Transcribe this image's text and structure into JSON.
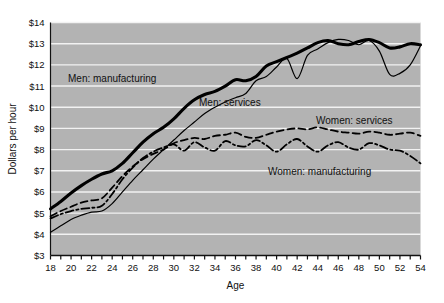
{
  "chart_data": {
    "type": "line",
    "title": "",
    "xlabel": "Age",
    "ylabel": "Dollars per hour",
    "xlim": [
      18,
      54
    ],
    "ylim": [
      3,
      14
    ],
    "grid": "horizontal",
    "legend_position": "inline-annotations",
    "plot_background": "#b3b3b3",
    "gridline_color": "#f2f2f2",
    "x_tick_labels": [
      "18",
      "20",
      "22",
      "24",
      "26",
      "28",
      "30",
      "32",
      "34",
      "36",
      "38",
      "40",
      "42",
      "44",
      "46",
      "48",
      "50",
      "52",
      "54"
    ],
    "x_tick_step": 2,
    "x_minor_tick_step": 1,
    "y_tick_labels": [
      "$3",
      "$4",
      "$5",
      "$6",
      "$7",
      "$8",
      "$9",
      "$10",
      "$11",
      "$12",
      "$13",
      "$14"
    ],
    "x": [
      18,
      19,
      20,
      21,
      22,
      23,
      24,
      25,
      26,
      27,
      28,
      29,
      30,
      31,
      32,
      33,
      34,
      35,
      36,
      37,
      38,
      39,
      40,
      41,
      42,
      43,
      44,
      45,
      46,
      47,
      48,
      49,
      50,
      51,
      52,
      53,
      54
    ],
    "series": [
      {
        "name": "Men: manufacturing",
        "label": "Men: manufacturing",
        "style": "solid-thick",
        "color": "#000000",
        "width": 3.1,
        "values": [
          5.2,
          5.55,
          5.95,
          6.3,
          6.6,
          6.85,
          7.0,
          7.35,
          7.85,
          8.35,
          8.75,
          9.05,
          9.45,
          9.95,
          10.35,
          10.6,
          10.75,
          11.0,
          11.3,
          11.25,
          11.45,
          11.95,
          12.15,
          12.35,
          12.55,
          12.8,
          13.05,
          13.15,
          13.0,
          12.95,
          13.1,
          13.2,
          13.05,
          12.8,
          12.85,
          13.0,
          12.95
        ]
      },
      {
        "name": "Men: services",
        "label": "Men: services",
        "style": "solid-thin",
        "color": "#000000",
        "width": 1.2,
        "values": [
          4.1,
          4.4,
          4.7,
          4.9,
          5.05,
          5.1,
          5.45,
          6.0,
          6.55,
          7.05,
          7.55,
          8.0,
          8.45,
          8.9,
          9.3,
          9.7,
          10.0,
          10.25,
          10.45,
          10.65,
          11.25,
          11.45,
          11.9,
          12.3,
          11.35,
          12.45,
          12.75,
          13.05,
          13.2,
          13.15,
          12.95,
          13.15,
          12.65,
          11.55,
          11.6,
          12.0,
          12.9
        ]
      },
      {
        "name": "Women: services",
        "label": "Women: services",
        "style": "dashed",
        "color": "#000000",
        "width": 1.8,
        "values": [
          4.85,
          5.1,
          5.3,
          5.5,
          5.6,
          5.7,
          6.2,
          6.75,
          7.2,
          7.55,
          7.8,
          8.0,
          8.3,
          8.45,
          8.55,
          8.5,
          8.65,
          8.7,
          8.8,
          8.6,
          8.55,
          8.7,
          8.85,
          8.95,
          9.0,
          8.95,
          9.05,
          8.95,
          8.85,
          8.8,
          8.75,
          8.85,
          8.8,
          8.7,
          8.75,
          8.8,
          8.65
        ]
      },
      {
        "name": "Women: manufacturing",
        "label": "Women: manufacturing",
        "style": "dash-dot",
        "color": "#000000",
        "width": 1.8,
        "values": [
          4.75,
          4.95,
          5.1,
          5.2,
          5.25,
          5.35,
          5.9,
          6.6,
          7.15,
          7.6,
          7.9,
          8.1,
          8.25,
          7.95,
          8.35,
          8.1,
          7.95,
          8.4,
          8.2,
          8.15,
          8.45,
          8.2,
          7.9,
          8.25,
          8.5,
          8.15,
          7.9,
          8.2,
          8.35,
          8.1,
          8.0,
          8.3,
          8.2,
          8.0,
          7.95,
          7.7,
          7.35
        ]
      }
    ],
    "annotations": [
      {
        "text": "Men: manufacturing",
        "x_px": 68,
        "y_px": 82
      },
      {
        "text": "Men: services",
        "x_px": 199,
        "y_px": 106
      },
      {
        "text": "Women: services",
        "x_px": 316,
        "y_px": 124
      },
      {
        "text": "Women: manufacturing",
        "x_px": 268,
        "y_px": 175
      }
    ]
  }
}
